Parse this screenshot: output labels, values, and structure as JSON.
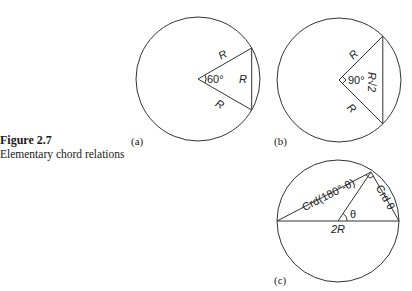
{
  "caption": {
    "figure_number": "Figure 2.7",
    "title": "Elementary chord relations"
  },
  "panels": [
    {
      "id": "a",
      "sublabel": "(a)",
      "central_angle_deg": 60,
      "angle_label": "60°",
      "radius_label_upper": "R",
      "radius_label_lower": "R",
      "chord_label": "R"
    },
    {
      "id": "b",
      "sublabel": "(b)",
      "central_angle_deg": 90,
      "angle_label": "90°",
      "radius_label_upper": "R",
      "radius_label_lower": "R",
      "chord_label": "R√2"
    },
    {
      "id": "c",
      "sublabel": "(c)",
      "theta_label": "θ",
      "diameter_label": "2R",
      "long_chord_label": "Crd(180°-θ)",
      "short_chord_label": "Crd θ"
    }
  ],
  "colors": {
    "stroke": "#333333",
    "text": "#222222"
  }
}
